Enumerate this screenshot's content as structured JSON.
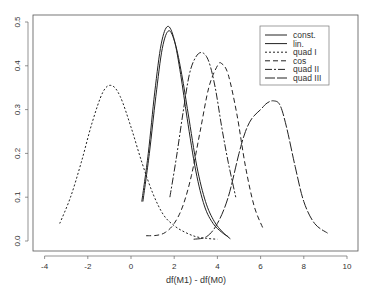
{
  "chart_data": {
    "type": "line",
    "title": "",
    "xlabel": "df(M1) - df(M0)",
    "ylabel": "",
    "xlim": [
      -4.3,
      10.4
    ],
    "ylim": [
      -0.005,
      0.52
    ],
    "xticks": [
      -4,
      -2,
      0,
      2,
      4,
      6,
      8,
      10
    ],
    "yticks": [
      0.0,
      0.1,
      0.2,
      0.3,
      0.4,
      0.5
    ],
    "ytick_labels": [
      "0.0",
      "0.1",
      "0.2",
      "0.3",
      "0.4",
      "0.5"
    ],
    "grid": false,
    "legend_position": "top-right",
    "series": [
      {
        "name": "const.",
        "dash": "",
        "peak_x": 1.7,
        "peak_y": 0.49,
        "x_start": 0.5,
        "x_end": 4.5,
        "x": [
          0.5,
          0.8,
          1.1,
          1.4,
          1.7,
          2.0,
          2.3,
          2.6,
          3.0,
          3.4,
          3.8,
          4.2,
          4.5
        ],
        "y": [
          0.09,
          0.2,
          0.34,
          0.45,
          0.49,
          0.46,
          0.38,
          0.28,
          0.16,
          0.08,
          0.04,
          0.02,
          0.01
        ]
      },
      {
        "name": "lin.",
        "dash": "",
        "peak_x": 1.75,
        "peak_y": 0.48,
        "x_start": 0.55,
        "x_end": 4.6,
        "x": [
          0.55,
          0.85,
          1.15,
          1.45,
          1.75,
          2.05,
          2.35,
          2.65,
          3.05,
          3.45,
          3.85,
          4.25,
          4.6
        ],
        "y": [
          0.09,
          0.2,
          0.33,
          0.44,
          0.48,
          0.45,
          0.38,
          0.29,
          0.17,
          0.09,
          0.045,
          0.02,
          0.005
        ]
      },
      {
        "name": "quad I",
        "dash": "2,2",
        "peak_x": -0.9,
        "peak_y": 0.355,
        "x_start": -3.3,
        "x_end": 4.0,
        "x": [
          -3.3,
          -2.8,
          -2.3,
          -1.8,
          -1.3,
          -0.9,
          -0.5,
          0.0,
          0.5,
          1.0,
          1.5,
          2.0,
          2.5,
          3.0,
          3.5,
          4.0
        ],
        "y": [
          0.04,
          0.1,
          0.18,
          0.27,
          0.34,
          0.355,
          0.33,
          0.26,
          0.18,
          0.11,
          0.06,
          0.035,
          0.02,
          0.01,
          0.006,
          0.004
        ]
      },
      {
        "name": "cos",
        "dash": "5,3",
        "peak_x": 4.2,
        "peak_y": 0.405,
        "x_start": 0.7,
        "x_end": 6.1,
        "x": [
          0.7,
          1.2,
          1.6,
          2.0,
          2.4,
          2.8,
          3.2,
          3.6,
          4.0,
          4.2,
          4.5,
          4.9,
          5.3,
          5.7,
          6.1
        ],
        "y": [
          0.012,
          0.013,
          0.02,
          0.04,
          0.08,
          0.15,
          0.25,
          0.35,
          0.4,
          0.405,
          0.38,
          0.29,
          0.17,
          0.08,
          0.03
        ]
      },
      {
        "name": "quad II",
        "dash": "7,2,2,2",
        "peak_x": 3.3,
        "peak_y": 0.43,
        "x_start": 1.8,
        "x_end": 4.85,
        "x": [
          1.8,
          2.1,
          2.4,
          2.7,
          3.0,
          3.3,
          3.6,
          3.9,
          4.2,
          4.5,
          4.85
        ],
        "y": [
          0.1,
          0.19,
          0.29,
          0.38,
          0.42,
          0.43,
          0.41,
          0.35,
          0.26,
          0.18,
          0.1
        ]
      },
      {
        "name": "quad III",
        "dash": "10,2",
        "peak_x": 6.6,
        "peak_y": 0.32,
        "x_start": 2.9,
        "x_end": 9.1,
        "x": [
          2.9,
          3.5,
          4.0,
          4.5,
          5.0,
          5.3,
          5.6,
          6.0,
          6.3,
          6.6,
          6.9,
          7.2,
          7.6,
          8.0,
          8.5,
          9.1
        ],
        "y": [
          0.004,
          0.01,
          0.04,
          0.1,
          0.2,
          0.25,
          0.28,
          0.3,
          0.315,
          0.32,
          0.31,
          0.26,
          0.17,
          0.09,
          0.04,
          0.018
        ]
      }
    ]
  }
}
